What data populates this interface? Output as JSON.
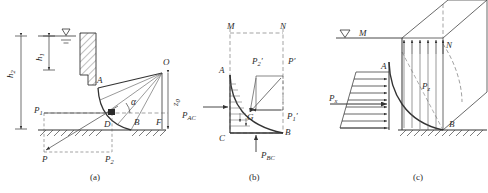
{
  "figure": {
    "type": "engineering-diagram",
    "width": 488,
    "height": 193,
    "line_color": "#333333",
    "dashed_color": "#555555",
    "background": "#ffffff"
  },
  "panels": [
    {
      "id": "a",
      "caption": "(a)",
      "labels": {
        "h1": "h",
        "h1_sub": "1",
        "h2": "h",
        "h2_sub": "2",
        "point_A": "A",
        "point_O": "O",
        "point_D": "D",
        "point_B": "B",
        "point_F": "F",
        "point_P": "P",
        "force_P1": "P",
        "force_P1_sub": "1",
        "force_P2": "P",
        "force_P2_sub": "2",
        "angle": "α",
        "depth_z": "z",
        "depth_z_sub": "0",
        "water_surface_icon": "water-level-triangle"
      }
    },
    {
      "id": "b",
      "caption": "(b)",
      "labels": {
        "point_M": "M",
        "point_N": "N",
        "point_A": "A",
        "point_B": "B",
        "point_C": "C",
        "point_G": "G",
        "force_PAC": "P",
        "force_PAC_sub": "AC",
        "force_PBC": "P",
        "force_PBC_sub": "BC",
        "force_Pprime": "P′",
        "force_P1prime": "P",
        "force_P1prime_sub": "1",
        "force_P1prime_mark": "′",
        "force_P2prime": "P",
        "force_P2prime_sub": "2",
        "force_P2prime_mark": "′"
      }
    },
    {
      "id": "c",
      "caption": "(c)",
      "labels": {
        "point_M": "M",
        "point_N": "N",
        "point_A": "A",
        "point_B": "B",
        "force_Px": "P",
        "force_Px_sub": "x",
        "force_Pz": "P",
        "force_Pz_sub": "z",
        "water_surface_icon": "water-level-triangle"
      }
    }
  ]
}
